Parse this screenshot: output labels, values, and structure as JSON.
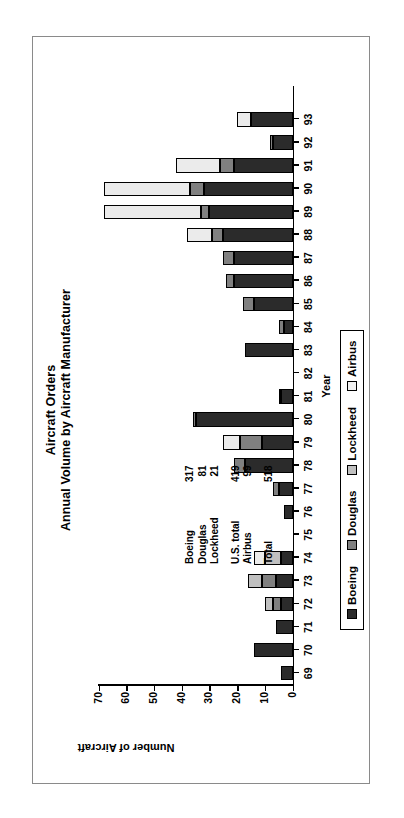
{
  "chart_data": {
    "type": "bar",
    "subtype": "stacked-bar",
    "title": "Aircraft Orders",
    "subtitle": "Annual Volume by Aircraft Manufacturer",
    "xlabel": "Year",
    "ylabel": "Number of Aircraft",
    "ylim": [
      0,
      70
    ],
    "yticks": [
      0,
      10,
      20,
      30,
      40,
      50,
      60,
      70
    ],
    "ytick_labels": [
      "0",
      "10",
      "20",
      "30",
      "40",
      "50",
      "60",
      "70"
    ],
    "grid": false,
    "legend_position": "bottom",
    "categories": [
      "69",
      "70",
      "71",
      "72",
      "73",
      "74",
      "75",
      "76",
      "77",
      "78",
      "79",
      "80",
      "81",
      "82",
      "83",
      "84",
      "85",
      "86",
      "87",
      "88",
      "89",
      "90",
      "91",
      "92",
      "93"
    ],
    "series": [
      {
        "name": "Boeing",
        "color": "#2b2b2b",
        "values": [
          4,
          14,
          6,
          4,
          6,
          4,
          0,
          3,
          5,
          17,
          11,
          35,
          4,
          0,
          17,
          3,
          14,
          21,
          21,
          25,
          30,
          32,
          21,
          7,
          15
        ]
      },
      {
        "name": "Douglas",
        "color": "#808080",
        "values": [
          0,
          0,
          0,
          3,
          5,
          0,
          0,
          0,
          2,
          4,
          8,
          1,
          1,
          0,
          0,
          2,
          4,
          3,
          4,
          4,
          3,
          5,
          5,
          1,
          0
        ]
      },
      {
        "name": "Lockheed",
        "color": "#c0c0c0",
        "values": [
          0,
          0,
          0,
          3,
          5,
          6,
          0,
          0,
          0,
          0,
          0,
          0,
          0,
          0,
          0,
          0,
          0,
          0,
          0,
          0,
          0,
          0,
          0,
          0,
          0
        ]
      },
      {
        "name": "Airbus",
        "color": "#ebebeb",
        "values": [
          0,
          0,
          0,
          0,
          0,
          4,
          0,
          0,
          0,
          0,
          6,
          0,
          0,
          0,
          0,
          0,
          0,
          0,
          0,
          9,
          35,
          31,
          16,
          0,
          5
        ]
      }
    ],
    "annotation_table": {
      "rows": [
        {
          "label": "Boeing",
          "value": "317"
        },
        {
          "label": "Douglas",
          "value": "81"
        },
        {
          "label": "Lockheed",
          "value": "21"
        },
        {
          "label": "",
          "value": "",
          "spacer": true
        },
        {
          "label": "U.S. total",
          "value": "419"
        },
        {
          "label": "Airbus",
          "value": "99"
        },
        {
          "label": "",
          "value": "",
          "spacer": true
        },
        {
          "label": "Total",
          "value": "518"
        }
      ]
    },
    "legend": [
      {
        "label": "Boeing",
        "color": "#2b2b2b"
      },
      {
        "label": "Douglas",
        "color": "#808080"
      },
      {
        "label": "Lockheed",
        "color": "#c0c0c0"
      },
      {
        "label": "Airbus",
        "color": "#f2f2f2"
      }
    ]
  },
  "colors": {
    "boeing": "#2b2b2b",
    "douglas": "#808080",
    "lockheed": "#c0c0c0",
    "airbus": "#f2f2f2",
    "frame": "#8a8a8a",
    "axis": "#000000"
  }
}
